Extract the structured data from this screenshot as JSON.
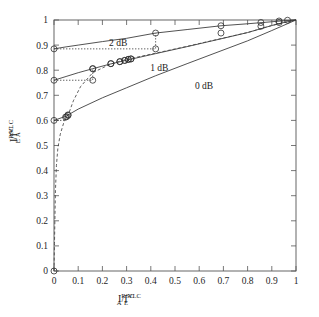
{
  "chart_data": {
    "type": "line",
    "title": "",
    "xlabel": "I_A^RSC / I_E^VLC",
    "ylabel": "I_E^RSC / I_A^VLC",
    "xlabel_parts": {
      "i": "I",
      "sub1": "A",
      "sup1": "RSC",
      "slash": "/I",
      "sub2": "E",
      "sup2": "VLC"
    },
    "ylabel_parts": {
      "i": "I",
      "sub1": "E",
      "sup1": "RSC",
      "slash": "/I",
      "sub2": "A",
      "sup2": "VLC"
    },
    "xlim": [
      0,
      1
    ],
    "ylim": [
      0,
      1
    ],
    "xticks": [
      0,
      0.1,
      0.2,
      0.3,
      0.4,
      0.5,
      0.6,
      0.7,
      0.8,
      0.9,
      1
    ],
    "yticks": [
      0,
      0.1,
      0.2,
      0.3,
      0.4,
      0.5,
      0.6,
      0.7,
      0.8,
      0.9,
      1
    ],
    "xticklabels": [
      "0",
      "0.1",
      "0.2",
      "0.3",
      "0.4",
      "0.5",
      "0.6",
      "0.7",
      "0.8",
      "0.9",
      "1"
    ],
    "yticklabels": [
      "0",
      "0.1",
      "0.2",
      "0.3",
      "0.4",
      "0.5",
      "0.6",
      "0.7",
      "0.8",
      "0.9",
      "1"
    ],
    "grid": false,
    "legend": "inline-annotations",
    "annotations": [
      {
        "text": "2 dB",
        "x": 0.265,
        "y": 0.895
      },
      {
        "text": "1 dB",
        "x": 0.435,
        "y": 0.795
      },
      {
        "text": "0 dB",
        "x": 0.62,
        "y": 0.727
      }
    ],
    "series": [
      {
        "name": "RSC 2 dB",
        "style": "solid",
        "color": "#333333",
        "x": [
          0.0,
          0.05,
          0.1,
          0.2,
          0.3,
          0.42,
          0.55,
          0.69,
          0.8,
          0.9,
          0.95,
          1.0
        ],
        "y": [
          0.885,
          0.893,
          0.9,
          0.914,
          0.927,
          0.948,
          0.962,
          0.977,
          0.985,
          0.993,
          0.997,
          1.0
        ]
      },
      {
        "name": "RSC 1 dB",
        "style": "solid",
        "color": "#333333",
        "x": [
          0.0,
          0.05,
          0.1,
          0.16,
          0.23,
          0.3,
          0.42,
          0.55,
          0.69,
          0.8,
          0.9,
          0.95,
          1.0
        ],
        "y": [
          0.76,
          0.775,
          0.79,
          0.806,
          0.824,
          0.84,
          0.866,
          0.894,
          0.925,
          0.95,
          0.978,
          0.99,
          1.0
        ]
      },
      {
        "name": "RSC 0 dB",
        "style": "solid",
        "color": "#333333",
        "x": [
          0.0,
          0.05,
          0.1,
          0.2,
          0.3,
          0.42,
          0.55,
          0.69,
          0.8,
          0.9,
          0.95,
          1.0
        ],
        "y": [
          0.6,
          0.617,
          0.645,
          0.69,
          0.73,
          0.778,
          0.826,
          0.877,
          0.917,
          0.958,
          0.979,
          1.0
        ]
      },
      {
        "name": "VLC inverted",
        "style": "dashed",
        "color": "#444444",
        "x": [
          0.0,
          0.002,
          0.004,
          0.006,
          0.01,
          0.016,
          0.026,
          0.04,
          0.052,
          0.06,
          0.08,
          0.11,
          0.16,
          0.23,
          0.28,
          0.31,
          0.42,
          0.55,
          0.69,
          0.8,
          0.9,
          0.95,
          1.0
        ],
        "y": [
          0.0,
          0.11,
          0.22,
          0.32,
          0.42,
          0.49,
          0.545,
          0.59,
          0.615,
          0.625,
          0.678,
          0.735,
          0.79,
          0.823,
          0.838,
          0.845,
          0.868,
          0.895,
          0.926,
          0.95,
          0.978,
          0.99,
          1.0
        ]
      }
    ],
    "markers": {
      "shape": "circle-open",
      "size": 3.0,
      "points_2db": [
        {
          "x": 0.0,
          "y": 0.885
        },
        {
          "x": 0.42,
          "y": 0.948
        },
        {
          "x": 0.69,
          "y": 0.977
        },
        {
          "x": 0.855,
          "y": 0.99
        },
        {
          "x": 0.93,
          "y": 0.996
        },
        {
          "x": 0.965,
          "y": 0.999
        }
      ],
      "points_1db": [
        {
          "x": 0.0,
          "y": 0.76
        },
        {
          "x": 0.16,
          "y": 0.806
        },
        {
          "x": 0.235,
          "y": 0.826
        },
        {
          "x": 0.272,
          "y": 0.834
        },
        {
          "x": 0.292,
          "y": 0.839
        },
        {
          "x": 0.307,
          "y": 0.843
        },
        {
          "x": 0.318,
          "y": 0.845
        },
        {
          "x": 0.42,
          "y": 0.885
        },
        {
          "x": 0.69,
          "y": 0.948
        },
        {
          "x": 0.855,
          "y": 0.975
        },
        {
          "x": 0.93,
          "y": 0.99
        }
      ],
      "points_0db": [
        {
          "x": 0.0,
          "y": 0.6
        },
        {
          "x": 0.048,
          "y": 0.613
        },
        {
          "x": 0.058,
          "y": 0.62
        }
      ],
      "points_vlc": [
        {
          "x": 0.0,
          "y": 0.0
        },
        {
          "x": 0.052,
          "y": 0.615
        },
        {
          "x": 0.058,
          "y": 0.622
        },
        {
          "x": 0.16,
          "y": 0.76
        },
        {
          "x": 0.16,
          "y": 0.806
        },
        {
          "x": 0.235,
          "y": 0.826
        },
        {
          "x": 0.272,
          "y": 0.834
        },
        {
          "x": 0.292,
          "y": 0.839
        },
        {
          "x": 0.307,
          "y": 0.843
        },
        {
          "x": 0.318,
          "y": 0.845
        }
      ]
    },
    "trajectories": [
      {
        "name": "staircase-2db",
        "style": "dotted",
        "points": [
          {
            "x": 0.0,
            "y": 0.885
          },
          {
            "x": 0.42,
            "y": 0.885
          },
          {
            "x": 0.42,
            "y": 0.948
          }
        ]
      },
      {
        "name": "staircase-1db",
        "style": "dotted",
        "points": [
          {
            "x": 0.0,
            "y": 0.76
          },
          {
            "x": 0.16,
            "y": 0.76
          },
          {
            "x": 0.16,
            "y": 0.806
          }
        ]
      },
      {
        "name": "staircase-0db",
        "style": "dotted",
        "points": [
          {
            "x": 0.0,
            "y": 0.6
          },
          {
            "x": 0.048,
            "y": 0.6
          },
          {
            "x": 0.048,
            "y": 0.613
          },
          {
            "x": 0.058,
            "y": 0.613
          },
          {
            "x": 0.058,
            "y": 0.62
          }
        ]
      }
    ]
  }
}
